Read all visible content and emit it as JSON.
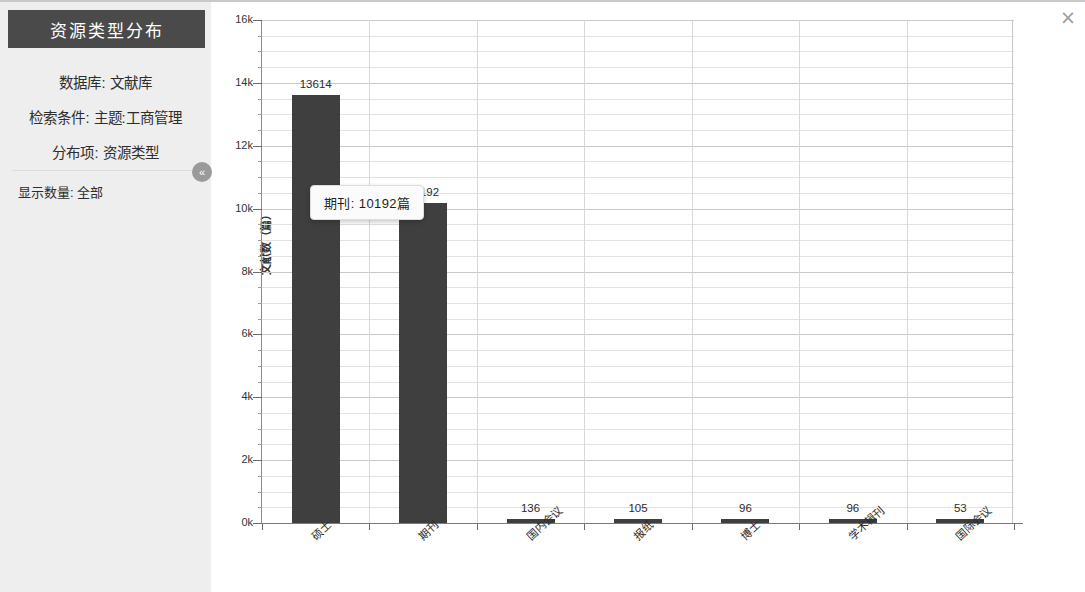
{
  "window": {
    "close_label": "×"
  },
  "sidebar": {
    "title": "资源类型分布",
    "collapse_label": "«",
    "meta": [
      {
        "label": "数据库:",
        "value": "文献库"
      },
      {
        "label": "检索条件:",
        "value": "主题:工商管理"
      },
      {
        "label": "分布项:",
        "value": "资源类型"
      }
    ],
    "count": {
      "label": "显示数量:",
      "value": "全部"
    }
  },
  "tooltip": {
    "text": "期刊: 10192篇"
  },
  "chart_data": {
    "type": "bar",
    "title": "",
    "xlabel": "",
    "ylabel": "文献数（篇）",
    "categories": [
      "硕士",
      "期刊",
      "国内会议",
      "报纸",
      "博士",
      "学术辑刊",
      "国际会议"
    ],
    "values": [
      13614,
      10192,
      136,
      105,
      96,
      96,
      53
    ],
    "value_labels": [
      "13614",
      "10192",
      "136",
      "105",
      "96",
      "96",
      "53"
    ],
    "ylim": [
      0,
      16000
    ],
    "yticks": [
      0,
      2000,
      4000,
      6000,
      8000,
      10000,
      12000,
      14000,
      16000
    ],
    "ytick_labels": [
      "0k",
      "2k",
      "4k",
      "6k",
      "8k",
      "10k",
      "12k",
      "14k",
      "16k"
    ],
    "grid": true,
    "legend": false,
    "bar_color": "#3f3f3f"
  }
}
